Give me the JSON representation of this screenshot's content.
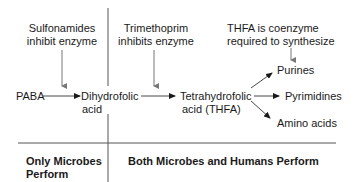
{
  "diagram": {
    "inhibitors": [
      {
        "line1": "Sulfonamides",
        "line2": "inhibit enzyme"
      },
      {
        "line1": "Trimethoprim",
        "line2": "inhibits enzyme"
      }
    ],
    "coenzyme_note": {
      "line1": "THFA is coenzyme",
      "line2": "required to synthesize"
    },
    "pathway": {
      "start": "PABA",
      "intermediate": {
        "line1": "Dihydrofolic",
        "line2": "acid"
      },
      "product": {
        "line1": "Tetrahydrofolic",
        "line2": "acid (THFA)"
      }
    },
    "outputs": [
      "Purines",
      "Pyrimidines",
      "Amino acids"
    ],
    "regions": {
      "left": {
        "line1": "Only Microbes",
        "line2": "Perform"
      },
      "right": "Both Microbes and Humans Perform"
    },
    "colors": {
      "text": "#1a1a1a",
      "line": "#555555",
      "inhibit_arrow": "#777777"
    }
  }
}
